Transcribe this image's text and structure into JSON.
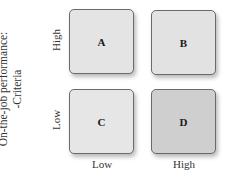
{
  "diagram": {
    "y_axis_title_line1": "On-the-job performance:",
    "y_axis_title_line2": "-Criteria",
    "y_ticks": {
      "high": "High",
      "low": "Low"
    },
    "x_ticks": {
      "low": "Low",
      "high": "High"
    },
    "cells": {
      "A": {
        "label": "A",
        "color": "#e4e4e4"
      },
      "B": {
        "label": "B",
        "color": "#e2e2e2"
      },
      "C": {
        "label": "C",
        "color": "#e6e6e6"
      },
      "D": {
        "label": "D",
        "color": "#cfcfcf"
      }
    }
  }
}
